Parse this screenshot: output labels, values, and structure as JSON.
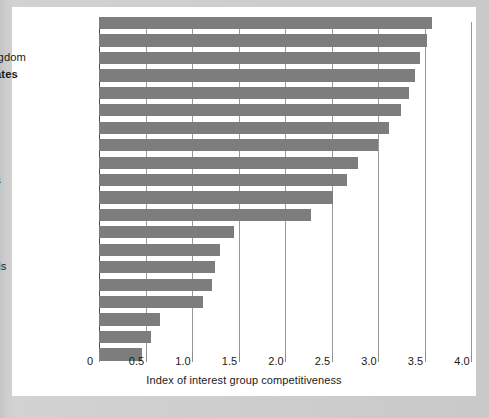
{
  "chart_data": {
    "type": "bar",
    "orientation": "horizontal",
    "title": "",
    "xlabel": "Index of interest group competitiveness",
    "ylabel": "",
    "xlim": [
      0,
      4.0
    ],
    "xticks": [
      "0",
      "0.5",
      "1.0",
      "1.5",
      "2.0",
      "2.5",
      "3.0",
      "3.5",
      "4.0"
    ],
    "xtick_values": [
      0,
      0.5,
      1.0,
      1.5,
      2.0,
      2.5,
      3.0,
      3.5,
      4.0
    ],
    "grid": "vertical",
    "legend": "none",
    "bar_color": "#7d7d7d",
    "highlight_category": "United States",
    "categories": [
      "Canada",
      "Greece",
      "United Kingdom",
      "United States",
      "Spain",
      "Italy",
      "Ireland",
      "France",
      "Australia",
      "Costa Rica",
      "India",
      "Venezuela",
      "Germany",
      "Japan",
      "Netherlands",
      "Israel",
      "Denmark",
      "Austria",
      "Sweden",
      "Norway"
    ],
    "values": [
      3.58,
      3.53,
      3.45,
      3.4,
      3.33,
      3.25,
      3.12,
      3.0,
      2.78,
      2.67,
      2.52,
      2.28,
      1.45,
      1.3,
      1.25,
      1.22,
      1.12,
      0.66,
      0.56,
      0.46
    ]
  }
}
